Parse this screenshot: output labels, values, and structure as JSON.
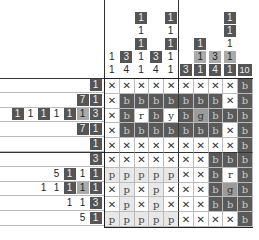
{
  "puzzle": {
    "type": "color-nonogram",
    "rows": 11,
    "cols": 10
  },
  "colors": {
    "b": "#5a5a5a",
    "p": "#e8e8e8",
    "g": "#9b9b9b",
    "r": "#ffffff",
    "y": "#ffffff"
  },
  "column_clues": [
    [
      {
        "v": "1",
        "c": "plain"
      },
      {
        "v": "1",
        "c": "plain"
      }
    ],
    [
      {
        "v": "3",
        "c": "dark"
      },
      {
        "v": "4",
        "c": "plain"
      }
    ],
    [
      {
        "v": "1",
        "c": "dark"
      },
      {
        "v": "1",
        "c": "plain"
      },
      {
        "v": "1",
        "c": "dark"
      },
      {
        "v": "1",
        "c": "plain"
      },
      {
        "v": "1",
        "c": "plain"
      }
    ],
    [
      {
        "v": "3",
        "c": "dark"
      },
      {
        "v": "4",
        "c": "plain"
      }
    ],
    [
      {
        "v": "1",
        "c": "dark"
      },
      {
        "v": "1",
        "c": "plain"
      },
      {
        "v": "1",
        "c": "dark"
      },
      {
        "v": "1",
        "c": "plain"
      },
      {
        "v": "1",
        "c": "plain"
      }
    ],
    [
      {
        "v": "3",
        "c": "dark"
      }
    ],
    [
      {
        "v": "1",
        "c": "dark"
      },
      {
        "v": "1",
        "c": "light"
      },
      {
        "v": "1",
        "c": "dark"
      }
    ],
    [
      {
        "v": "3",
        "c": "light"
      },
      {
        "v": "4",
        "c": "dark"
      }
    ],
    [
      {
        "v": "1",
        "c": "dark"
      },
      {
        "v": "1",
        "c": "dark"
      },
      {
        "v": "1",
        "c": "plain"
      },
      {
        "v": "1",
        "c": "light"
      },
      {
        "v": "1",
        "c": "dark"
      }
    ],
    [
      {
        "v": "10",
        "c": "dark"
      }
    ]
  ],
  "row_clues": [
    [
      {
        "v": "1",
        "c": "dark"
      }
    ],
    [
      {
        "v": "7",
        "c": "dark"
      },
      {
        "v": "1",
        "c": "dark"
      }
    ],
    [
      {
        "v": "1",
        "c": "dark"
      },
      {
        "v": "1",
        "c": "plain"
      },
      {
        "v": "1",
        "c": "dark"
      },
      {
        "v": "1",
        "c": "plain"
      },
      {
        "v": "1",
        "c": "dark"
      },
      {
        "v": "1",
        "c": "light"
      },
      {
        "v": "3",
        "c": "dark"
      }
    ],
    [
      {
        "v": "7",
        "c": "dark"
      },
      {
        "v": "1",
        "c": "dark"
      }
    ],
    [
      {
        "v": "1",
        "c": "dark"
      }
    ],
    [
      {
        "v": "3",
        "c": "dark"
      }
    ],
    [
      {
        "v": "5",
        "c": "plain"
      },
      {
        "v": "1",
        "c": "dark"
      },
      {
        "v": "1",
        "c": "plain"
      },
      {
        "v": "1",
        "c": "dark"
      }
    ],
    [
      {
        "v": "1",
        "c": "plain"
      },
      {
        "v": "1",
        "c": "plain"
      },
      {
        "v": "1",
        "c": "dark"
      },
      {
        "v": "1",
        "c": "light"
      },
      {
        "v": "1",
        "c": "dark"
      }
    ],
    [
      {
        "v": "1",
        "c": "plain"
      },
      {
        "v": "1",
        "c": "plain"
      },
      {
        "v": "3",
        "c": "dark"
      }
    ],
    [
      {
        "v": "5",
        "c": "plain"
      },
      {
        "v": "1",
        "c": "dark"
      }
    ]
  ],
  "grid": [
    [
      "x",
      "x",
      "x",
      "x",
      "x",
      "x",
      "x",
      "x",
      "x",
      "b"
    ],
    [
      "x",
      "b",
      "b",
      "b",
      "b",
      "b",
      "b",
      "b",
      "x",
      "b"
    ],
    [
      "x",
      "b",
      "r",
      "b",
      "y",
      "b",
      "g",
      "b",
      "b",
      "b"
    ],
    [
      "x",
      "b",
      "b",
      "b",
      "b",
      "b",
      "b",
      "b",
      "x",
      "b"
    ],
    [
      "x",
      "x",
      "x",
      "x",
      "x",
      "x",
      "x",
      "x",
      "x",
      "b"
    ],
    [
      "x",
      "x",
      "x",
      "x",
      "x",
      "x",
      "x",
      "b",
      "b",
      "b"
    ],
    [
      "p",
      "p",
      "p",
      "p",
      "p",
      "x",
      "x",
      "b",
      "r",
      "b"
    ],
    [
      "x",
      "p",
      "x",
      "p",
      "x",
      "x",
      "x",
      "b",
      "g",
      "b"
    ],
    [
      "x",
      "p",
      "x",
      "p",
      "x",
      "x",
      "x",
      "b",
      "b",
      "b"
    ],
    [
      "p",
      "p",
      "p",
      "p",
      "p",
      "x",
      "x",
      "x",
      "x",
      "b"
    ]
  ]
}
